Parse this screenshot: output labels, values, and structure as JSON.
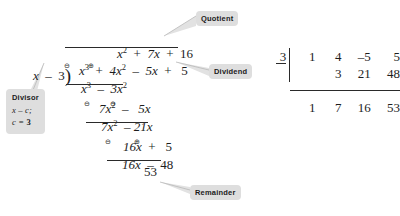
{
  "figure": {
    "kind": "polynomial-long-division-and-synthetic-division",
    "divisor_expression": "x - 3",
    "dividend_expression": "x^3 + 4x^2 - 5x + 5",
    "quotient_expression": "x^2 + 7x + 16",
    "remainder_value": "53"
  },
  "long_division": {
    "quotient": {
      "t1": "x",
      "t1_exp": "2",
      "op1": "+",
      "t2": "7x",
      "op2": "+",
      "t3": "16"
    },
    "divisor": {
      "var": "x",
      "op": "–",
      "num": "3"
    },
    "dividend": {
      "t1": "x",
      "t1_exp": "3",
      "op1": "+",
      "t2": "4x",
      "t2_exp": "2",
      "op2": "–",
      "t3": "5x",
      "op3": "+",
      "t4": "5"
    },
    "step1": {
      "mark1": "⊖",
      "t1": "x",
      "t1_exp": "3",
      "mark2": "⊕",
      "op": "–",
      "t2": "3x",
      "t2_exp": "2"
    },
    "bring1": {
      "t1": "7x",
      "t1_exp": "2",
      "op": "–",
      "t2": "5x"
    },
    "step2": {
      "mark1": "⊖",
      "t1": "7x",
      "t1_exp": "2",
      "mark2": "⊖",
      "op": "–",
      "t2": "21x"
    },
    "bring2": {
      "t1": "16x",
      "op": "+",
      "t2": "5"
    },
    "step3": {
      "mark1": "⊖",
      "t1": "16x",
      "mark2": "⊕",
      "op": "–",
      "t2": "48"
    },
    "remainder": "53"
  },
  "callouts": {
    "quotient": "Quotient",
    "dividend": "Dividend",
    "remainder": "Remainder",
    "divisor": {
      "title": "Divisor",
      "line2_a": "x – c",
      "line2_b": ";",
      "line3_a": "c = ",
      "line3_b": "3"
    }
  },
  "synthetic_division": {
    "c": "3",
    "coefficients": [
      "1",
      "4",
      "–5",
      "5"
    ],
    "products": [
      "",
      "3",
      "21",
      "48"
    ],
    "results": [
      "1",
      "7",
      "16",
      "53"
    ]
  },
  "colors": {
    "ink": "#1d1d1d",
    "callout_bg": "#dedede",
    "callout_text": "#1b1b1b",
    "rule": "#2a2a2a",
    "page_bg": "#ffffff"
  }
}
